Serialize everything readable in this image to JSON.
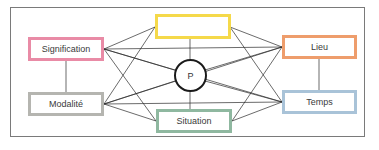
{
  "diagram": {
    "center": {
      "label": "P"
    },
    "nodes": {
      "top": {
        "label": "",
        "border_color": "#f5d94a"
      },
      "signification": {
        "label": "Signification",
        "border_color": "#e98ba6"
      },
      "modalite": {
        "label": "Modalité",
        "border_color": "#b5b5b0"
      },
      "situation": {
        "label": "Situation",
        "border_color": "#8fb8a0"
      },
      "lieu": {
        "label": "Lieu",
        "border_color": "#ee9d6c"
      },
      "temps": {
        "label": "Temps",
        "border_color": "#a9c3d8"
      }
    },
    "edges": [
      [
        "signification",
        "top"
      ],
      [
        "signification",
        "lieu"
      ],
      [
        "signification",
        "temps"
      ],
      [
        "signification",
        "situation"
      ],
      [
        "signification",
        "modalite"
      ],
      [
        "signification",
        "center"
      ],
      [
        "modalite",
        "top"
      ],
      [
        "modalite",
        "lieu"
      ],
      [
        "modalite",
        "temps"
      ],
      [
        "modalite",
        "situation"
      ],
      [
        "modalite",
        "center"
      ],
      [
        "lieu",
        "top"
      ],
      [
        "lieu",
        "situation"
      ],
      [
        "lieu",
        "temps"
      ],
      [
        "lieu",
        "center"
      ],
      [
        "temps",
        "top"
      ],
      [
        "temps",
        "situation"
      ],
      [
        "temps",
        "center"
      ],
      [
        "top",
        "center"
      ],
      [
        "situation",
        "center"
      ]
    ]
  }
}
